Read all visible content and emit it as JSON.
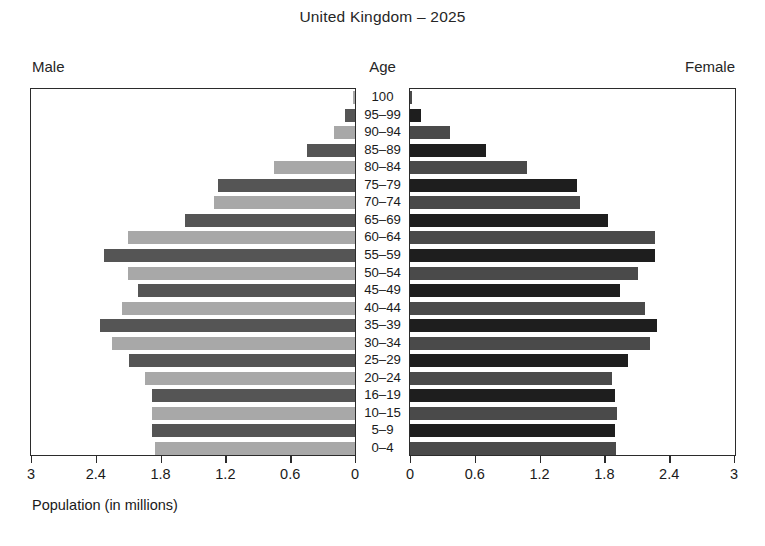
{
  "chart_data": {
    "type": "bar",
    "subtype": "population-pyramid",
    "title": "United Kingdom – 2025",
    "xlabel": "Population (in millions)",
    "ylabel": "Age",
    "grid": false,
    "legend_position": "none",
    "xlim": [
      0,
      3
    ],
    "xticks": [
      0,
      0.6,
      1.2,
      1.8,
      2.4,
      3
    ],
    "left_side_label": "Male",
    "right_side_label": "Female",
    "center_axis_label": "Age",
    "left_tick_labels": [
      "3",
      "2.4",
      "1.8",
      "1.2",
      "0.6",
      "0"
    ],
    "right_tick_labels": [
      "0",
      "0.6",
      "1.2",
      "1.8",
      "2.4",
      "3"
    ],
    "categories": [
      "100",
      "95–99",
      "90–94",
      "85–89",
      "80–84",
      "75–79",
      "70–74",
      "65–69",
      "60–64",
      "55–59",
      "50–54",
      "45–49",
      "40–44",
      "35–39",
      "30–34",
      "25–29",
      "20–24",
      "16–19",
      "10–15",
      "5–9",
      "0–4"
    ],
    "series": [
      {
        "name": "Male",
        "side": "left",
        "values": [
          0.02,
          0.09,
          0.19,
          0.44,
          0.75,
          1.27,
          1.31,
          1.57,
          2.1,
          2.32,
          2.1,
          2.01,
          2.16,
          2.36,
          2.25,
          2.09,
          1.94,
          1.88,
          1.88,
          1.88,
          1.85
        ]
      },
      {
        "name": "Female",
        "side": "right",
        "values": [
          0.02,
          0.1,
          0.37,
          0.7,
          1.08,
          1.55,
          1.57,
          1.83,
          2.27,
          2.27,
          2.11,
          1.94,
          2.18,
          2.29,
          2.22,
          2.02,
          1.87,
          1.9,
          1.92,
          1.9,
          1.91
        ]
      }
    ]
  },
  "colors": {
    "male_light": "#a8a8a8",
    "male_dark": "#555555",
    "female_light": "#4a4a4a",
    "female_dark": "#1e1e1e",
    "frame": "#2b2b2b",
    "text": "#1a1a1a",
    "background": "#ffffff"
  }
}
